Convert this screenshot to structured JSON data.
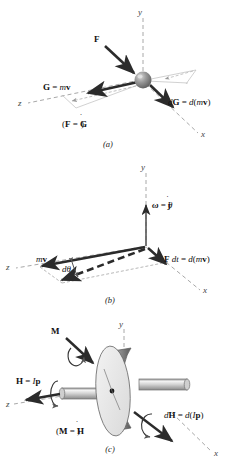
{
  "figure": {
    "background": "#ffffff",
    "panels": [
      {
        "id": "a",
        "caption": "(a)",
        "relation": "(F = Ġ)",
        "axes": {
          "x": "x",
          "y": "y",
          "z": "z"
        },
        "labels": {
          "force": "F",
          "momentum": "G = mv",
          "momentum_change": "dG = d(mv)"
        },
        "colors": {
          "vector": "#2b2b2b",
          "axis": "#9a9a9a",
          "construction": "#b4b4b4",
          "sphere": "#8f8f8f"
        }
      },
      {
        "id": "b",
        "caption": "(b)",
        "axes": {
          "x": "x",
          "y": "y",
          "z": "z"
        },
        "labels": {
          "angular_velocity": "ω = θ̇j",
          "momentum": "mv",
          "angle": "dθ",
          "impulse": "F dt = d(mv)"
        },
        "colors": {
          "vector": "#2b2b2b",
          "axis": "#9a9a9a",
          "dashed_vector": "#333333"
        }
      },
      {
        "id": "c",
        "caption": "(c)",
        "relation": "(M = Ḣ)",
        "axes": {
          "x": "x",
          "y": "y",
          "z": "z"
        },
        "labels": {
          "moment": "M",
          "angular_momentum": "H = Ip",
          "angular_momentum_change": "dH = d(Ip)"
        },
        "colors": {
          "vector": "#2b2b2b",
          "axis": "#9a9a9a",
          "disk_face": "#e8e8e8",
          "disk_rim": "#777777",
          "shaft": "#c9c9c9"
        }
      }
    ]
  }
}
